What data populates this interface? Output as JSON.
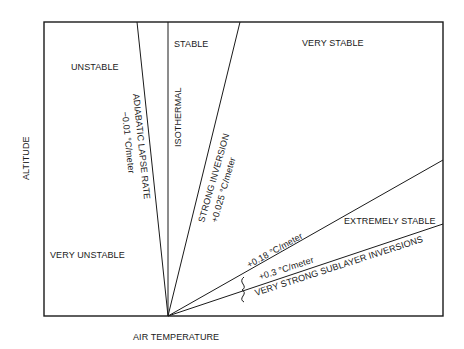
{
  "axes": {
    "x_label": "AIR TEMPERATURE",
    "y_label": "ALTITUDE"
  },
  "regions": {
    "unstable": "UNSTABLE",
    "very_unstable": "VERY UNSTABLE",
    "stable": "STABLE",
    "very_stable": "VERY STABLE",
    "extremely_stable": "EXTREMELY STABLE"
  },
  "lines": {
    "adiabatic_title": "ADIABATIC LAPSE RATE",
    "adiabatic_rate": "−0.01 °C/meter",
    "isothermal": "ISOTHERMAL",
    "strong_inversion_title": "STRONG INVERSION",
    "strong_inversion_rate": "+0.025 °C/meter",
    "rate_018": "+0.18 °C/meter",
    "rate_03": "+0.3 °C/meter",
    "sublayer": "VERY STRONG SUBLAYER INVERSIONS"
  },
  "colors": {
    "ink": "#1a1a1a",
    "background": "#ffffff"
  }
}
